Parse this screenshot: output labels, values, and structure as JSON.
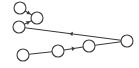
{
  "diagram": {
    "type": "directed-graph",
    "background": "#ffffff",
    "stroke_color": "#3a3a3a",
    "node_fill": "#ffffff",
    "node_radius": 6,
    "nodes": [
      {
        "id": "A",
        "x": 20,
        "y": 8
      },
      {
        "id": "B",
        "x": 37,
        "y": 18
      },
      {
        "id": "C",
        "x": 19,
        "y": 27
      },
      {
        "id": "D",
        "x": 127,
        "y": 41
      },
      {
        "id": "E",
        "x": 89,
        "y": 46
      },
      {
        "id": "F",
        "x": 58,
        "y": 51
      },
      {
        "id": "G",
        "x": 23,
        "y": 55
      }
    ],
    "edges": [
      {
        "from": "A",
        "to": "B",
        "directed": true,
        "arrow_pos": 0.55
      },
      {
        "from": "C",
        "to": "B",
        "directed": true,
        "arrow_pos": 0.55
      },
      {
        "from": "D",
        "to": "C",
        "directed": true,
        "arrow_pos": 0.52
      },
      {
        "from": "G",
        "to": "F",
        "directed": false
      },
      {
        "from": "F",
        "to": "E",
        "directed": true,
        "arrow_pos": 0.5
      },
      {
        "from": "E",
        "to": "D",
        "directed": false
      }
    ]
  }
}
